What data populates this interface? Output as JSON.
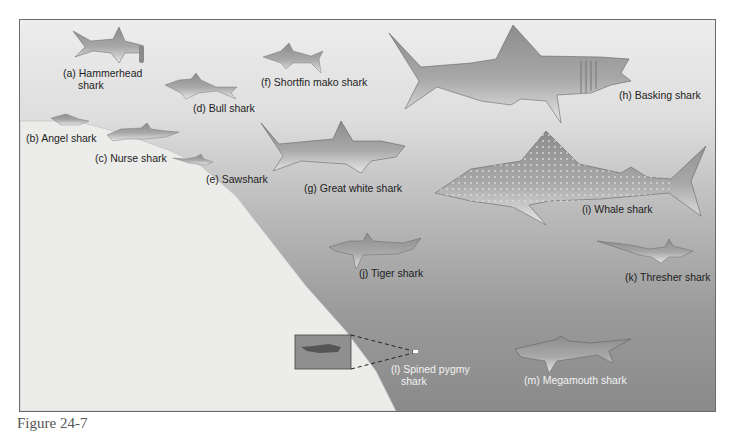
{
  "figure": {
    "caption": "Figure 24-7",
    "colors": {
      "water_top": "#ededed",
      "water_bottom": "#8a8a8a",
      "seabed": "#ececea",
      "frame_border": "#6b6b6b",
      "shark_fill": "#9c9c9c",
      "label_dark": "#1d1d1d",
      "label_light": "#f2f2f2"
    }
  },
  "sharks": [
    {
      "id": "a",
      "label": "(a) Hammerhead",
      "label2": "shark",
      "icon": "hammerhead-shark-icon"
    },
    {
      "id": "b",
      "label": "(b) Angel shark",
      "icon": "angel-shark-icon"
    },
    {
      "id": "c",
      "label": "(c) Nurse shark",
      "icon": "nurse-shark-icon"
    },
    {
      "id": "d",
      "label": "(d) Bull shark",
      "icon": "bull-shark-icon"
    },
    {
      "id": "e",
      "label": "(e) Sawshark",
      "icon": "sawshark-icon"
    },
    {
      "id": "f",
      "label": "(f) Shortfin mako shark",
      "icon": "shortfin-mako-shark-icon"
    },
    {
      "id": "g",
      "label": "(g) Great white shark",
      "icon": "great-white-shark-icon"
    },
    {
      "id": "h",
      "label": "(h) Basking shark",
      "icon": "basking-shark-icon"
    },
    {
      "id": "i",
      "label": "(i) Whale shark",
      "icon": "whale-shark-icon"
    },
    {
      "id": "j",
      "label": "(j) Tiger shark",
      "icon": "tiger-shark-icon"
    },
    {
      "id": "k",
      "label": "(k) Thresher shark",
      "icon": "thresher-shark-icon"
    },
    {
      "id": "l",
      "label": "(l) Spined pygmy",
      "label2": "shark",
      "icon": "spined-pygmy-shark-icon"
    },
    {
      "id": "m",
      "label": "(m) Megamouth shark",
      "icon": "megamouth-shark-icon"
    }
  ]
}
